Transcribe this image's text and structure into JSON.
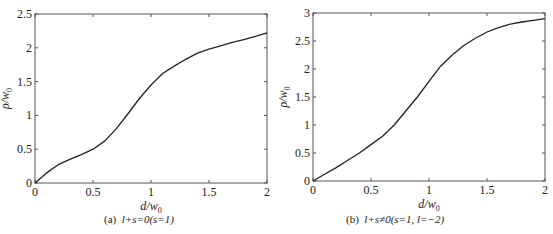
{
  "chart_data": [
    {
      "type": "line",
      "panel_label": "(a)",
      "caption": "l+s=0(s=1)",
      "xlabel": "d/w0",
      "ylabel": "ρ/w0",
      "xlim": [
        0,
        2
      ],
      "ylim": [
        0,
        2.5
      ],
      "xticks": [
        "0",
        "0.5",
        "1",
        "1.5",
        "2"
      ],
      "yticks": [
        "0",
        "0.5",
        "1",
        "1.5",
        "2",
        "2.5"
      ],
      "grid": false,
      "series": [
        {
          "name": "l+s=0",
          "x": [
            0,
            0.1,
            0.2,
            0.3,
            0.4,
            0.5,
            0.6,
            0.7,
            0.8,
            0.9,
            1.0,
            1.1,
            1.2,
            1.3,
            1.4,
            1.5,
            1.6,
            1.7,
            1.8,
            1.9,
            2.0
          ],
          "y": [
            0,
            0.15,
            0.27,
            0.35,
            0.42,
            0.5,
            0.62,
            0.8,
            1.02,
            1.25,
            1.45,
            1.62,
            1.73,
            1.83,
            1.92,
            1.98,
            2.03,
            2.08,
            2.12,
            2.17,
            2.22
          ]
        }
      ]
    },
    {
      "type": "line",
      "panel_label": "(b)",
      "caption": "l+s≠0(s=1, l=−2)",
      "xlabel": "d/w0",
      "ylabel": "ρ/w0",
      "xlim": [
        0,
        2
      ],
      "ylim": [
        0,
        3
      ],
      "xticks": [
        "0",
        "0.5",
        "1",
        "1.5",
        "2"
      ],
      "yticks": [
        "0",
        "0.5",
        "1",
        "1.5",
        "2",
        "2.5",
        "3"
      ],
      "grid": false,
      "series": [
        {
          "name": "l+s≠0",
          "x": [
            0,
            0.1,
            0.2,
            0.3,
            0.4,
            0.5,
            0.6,
            0.7,
            0.8,
            0.9,
            1.0,
            1.1,
            1.2,
            1.3,
            1.4,
            1.5,
            1.6,
            1.7,
            1.8,
            1.9,
            2.0
          ],
          "y": [
            0,
            0.12,
            0.24,
            0.37,
            0.5,
            0.65,
            0.8,
            1.0,
            1.25,
            1.5,
            1.78,
            2.05,
            2.25,
            2.42,
            2.55,
            2.66,
            2.74,
            2.8,
            2.84,
            2.87,
            2.9
          ]
        }
      ]
    }
  ],
  "panels": [
    {
      "label": "(a)",
      "caption_math": "l+s=0(s=1)",
      "xlabel_main": "d/w",
      "xlabel_sub": "0",
      "ylabel_main": "ρ/w",
      "ylabel_sub": "0"
    },
    {
      "label": "(b)",
      "caption_math": "l+s≠0(s=1, l=−2)",
      "xlabel_main": "d/w",
      "xlabel_sub": "0",
      "ylabel_main": "ρ/w",
      "ylabel_sub": "0"
    }
  ]
}
